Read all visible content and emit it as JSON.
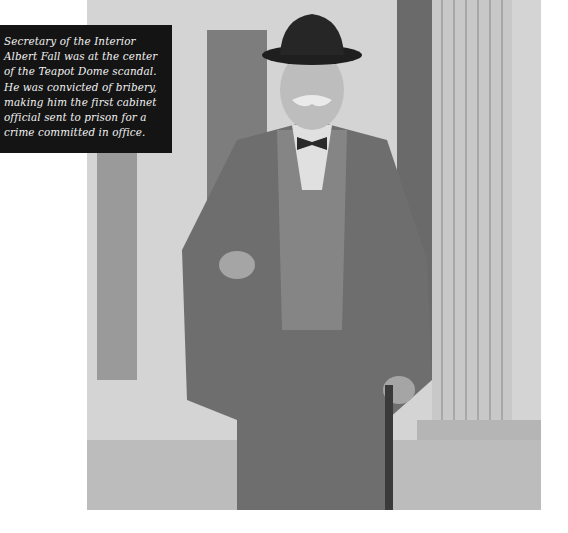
{
  "photo": {
    "subject": "Albert Fall",
    "description": "Black and white photograph of a man in a hat, suit, bow tie and glasses holding a cigar and a cane, standing beside building columns"
  },
  "caption": {
    "lines": [
      "Secretary of the Interior",
      "Albert Fall was at the center",
      "of the Teapot Dome scandal.",
      "He was convicted of bribery,",
      "making him the first cabinet",
      "official sent to prison for a",
      "crime committed in office."
    ]
  }
}
